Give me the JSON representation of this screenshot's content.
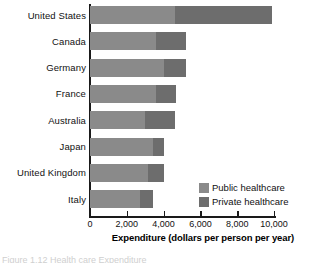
{
  "chart_data": {
    "type": "bar",
    "orientation": "horizontal",
    "stacked": true,
    "title": "",
    "xlabel": "Expenditure (dollars per person per year)",
    "ylabel": "",
    "xlim": [
      0,
      10000
    ],
    "xticks": [
      0,
      2000,
      4000,
      6000,
      8000,
      10000
    ],
    "xticklabels": [
      "0",
      "2,000",
      "4,000",
      "6,000",
      "8,000",
      "10,000"
    ],
    "grid": false,
    "legend_position": "inside-lower-right",
    "categories": [
      "United States",
      "Canada",
      "Germany",
      "France",
      "Australia",
      "Japan",
      "United Kingdom",
      "Italy"
    ],
    "series": [
      {
        "name": "Public healthcare",
        "color": "#8a8a8a",
        "values": [
          4600,
          3600,
          4000,
          3600,
          3000,
          3400,
          3150,
          2700
        ]
      },
      {
        "name": "Private healthcare",
        "color": "#6d6d6d",
        "values": [
          5300,
          1600,
          1200,
          1100,
          1600,
          600,
          850,
          700
        ]
      }
    ],
    "totals": [
      9900,
      5200,
      5200,
      4700,
      4600,
      4000,
      4000,
      3400
    ]
  },
  "legend": {
    "entries": [
      {
        "label": "Public healthcare",
        "swatch": "public-swatch"
      },
      {
        "label": "Private healthcare",
        "swatch": "private-swatch"
      }
    ]
  },
  "caption": {
    "text": "Figure 1.12  Health care Expenditure"
  }
}
